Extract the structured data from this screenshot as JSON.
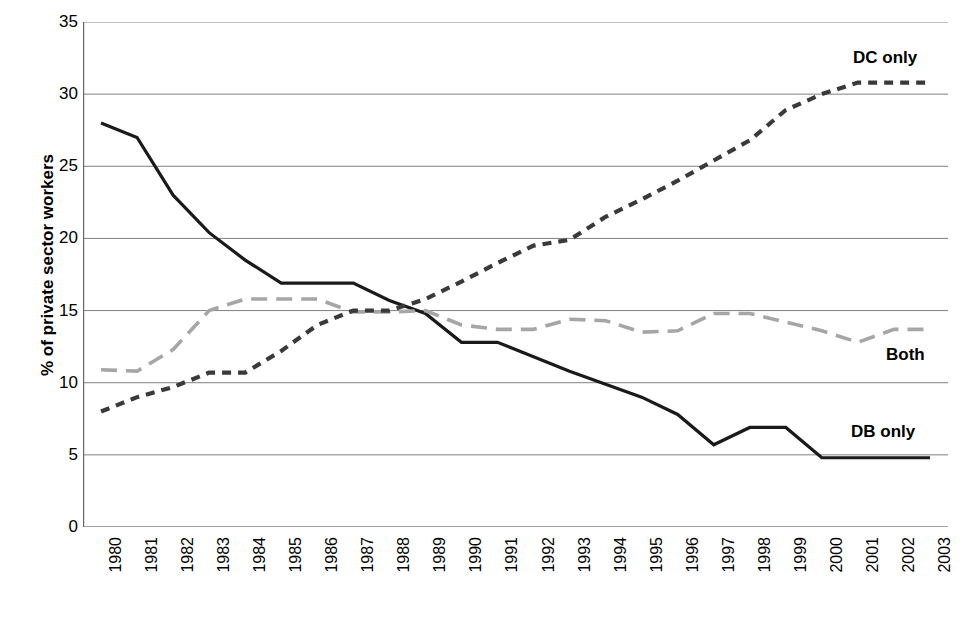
{
  "chart_data": {
    "type": "line",
    "title": "",
    "subtitle": "",
    "xlabel": "",
    "ylabel": "% of private sector workers",
    "ylim": [
      0,
      35
    ],
    "ytick_step": 5,
    "yticks": [
      "35",
      "30",
      "25",
      "20",
      "15",
      "10",
      "5",
      "0"
    ],
    "grid": true,
    "legend_position": "inline-annotations",
    "categories": [
      "1980",
      "1981",
      "1982",
      "1983",
      "1984",
      "1985",
      "1986",
      "1987",
      "1988",
      "1989",
      "1990",
      "1991",
      "1992",
      "1993",
      "1994",
      "1995",
      "1996",
      "1997",
      "1998",
      "1999",
      "2000",
      "2001",
      "2002",
      "2003"
    ],
    "series": [
      {
        "name": "DB only",
        "style": "solid",
        "color": "#1a1a1a",
        "label": "DB only",
        "values": [
          28.0,
          27.0,
          23.0,
          20.4,
          18.5,
          16.9,
          16.9,
          16.9,
          15.7,
          14.8,
          12.8,
          12.8,
          11.8,
          10.8,
          9.9,
          9.0,
          7.8,
          5.7,
          6.9,
          6.9,
          4.8,
          4.8,
          4.8,
          4.8
        ]
      },
      {
        "name": "Both",
        "style": "dashed",
        "color": "#a6a6a6",
        "label": "Both",
        "values": [
          10.9,
          10.8,
          12.3,
          15.0,
          15.8,
          15.8,
          15.8,
          14.9,
          14.9,
          15.0,
          14.0,
          13.7,
          13.7,
          14.4,
          14.3,
          13.5,
          13.6,
          14.8,
          14.8,
          14.2,
          13.6,
          12.8,
          13.7,
          13.7
        ]
      },
      {
        "name": "DC only",
        "style": "dotted",
        "color": "#3a3a3a",
        "label": "DC only",
        "values": [
          8.0,
          9.0,
          9.7,
          10.7,
          10.7,
          12.2,
          14.0,
          15.0,
          15.0,
          15.8,
          17.0,
          18.3,
          19.5,
          19.9,
          21.5,
          22.7,
          24.0,
          25.4,
          26.8,
          28.9,
          30.0,
          30.8,
          30.8,
          30.8
        ]
      }
    ]
  },
  "annotations": {
    "dc_only": "DC only",
    "both": "Both",
    "db_only": "DB only"
  },
  "axis": {
    "y_title": "% of private sector workers"
  },
  "colors": {
    "db_only": "#1a1a1a",
    "both": "#a6a6a6",
    "dc_only": "#3a3a3a",
    "grid": "#808080",
    "axis": "#666666"
  }
}
